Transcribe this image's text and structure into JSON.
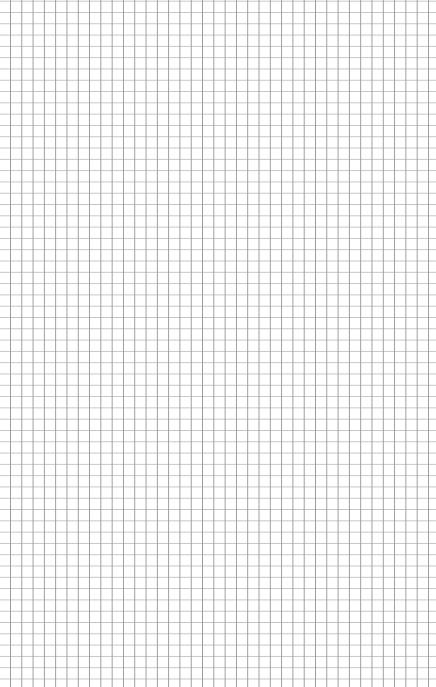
{
  "page": {
    "type": "graph-paper",
    "width": 436,
    "height": 687,
    "background_color": "#ffffff"
  },
  "grid": {
    "cell_size_px": 11.3,
    "offset_x_px": 10,
    "offset_y_px": 12,
    "vertical_line_color": "#9a9a9a",
    "horizontal_line_color": "#c4c4c4",
    "vertical_line_count": 38,
    "horizontal_line_count": 60
  }
}
